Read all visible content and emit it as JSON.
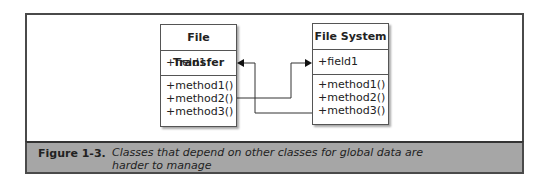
{
  "diagram": {
    "classes": [
      {
        "name": "File Transfer",
        "fields": [
          "+field1"
        ],
        "methods": [
          "+method1()",
          "+method2()",
          "+method3()"
        ]
      },
      {
        "name": "File System",
        "fields": [
          "+field1"
        ],
        "methods": [
          "+method1()",
          "+method2()",
          "+method3()"
        ]
      }
    ],
    "connections": [
      {
        "from": "File Transfer.method2()",
        "to": "File System.field1"
      },
      {
        "from": "File System.method3()",
        "to": "File Transfer.field1"
      }
    ]
  },
  "caption": {
    "label": "Figure 1-3.",
    "text": "Classes that depend on other classes for global data are harder to manage"
  },
  "colors": {
    "frame": "#4a4a4a",
    "caption_bg": "#a6a6a6"
  }
}
